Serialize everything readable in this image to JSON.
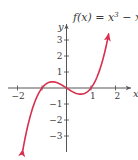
{
  "chart_data": {
    "type": "line",
    "title_display": {
      "fx": "f(x) = x",
      "sup": "3",
      "tail": " − x"
    },
    "xlabel": "x",
    "ylabel": "y",
    "xlim": [
      -2.35,
      2.6
    ],
    "ylim": [
      -4.0,
      3.9
    ],
    "x_ticks": [
      -2,
      -1,
      1,
      2
    ],
    "x_tick_labels": [
      "−2",
      "",
      "1",
      "2"
    ],
    "y_ticks": [
      -3,
      -2,
      -1,
      1,
      2,
      3
    ],
    "y_tick_labels": [
      "−3",
      "−2",
      "−1",
      "1",
      "2",
      "3"
    ],
    "grid": false,
    "legend": null,
    "series": [
      {
        "name": "f(x) = x^3 − x",
        "function": "x^3 - x",
        "x_range": [
          -1.78,
          1.72
        ],
        "arrows_at_both_ends": true,
        "color": "#d6304e",
        "key_points": [
          {
            "x": -1.78,
            "y": -3.86
          },
          {
            "x": -1,
            "y": 0
          },
          {
            "x": -0.577,
            "y": 0.385
          },
          {
            "x": 0,
            "y": 0
          },
          {
            "x": 0.577,
            "y": -0.385
          },
          {
            "x": 1,
            "y": 0
          },
          {
            "x": 1.72,
            "y": 3.37
          }
        ]
      }
    ]
  },
  "style": {
    "curve_color": "#d6304e",
    "axis_color": "#555555",
    "text_color": "#3a3a3a"
  }
}
